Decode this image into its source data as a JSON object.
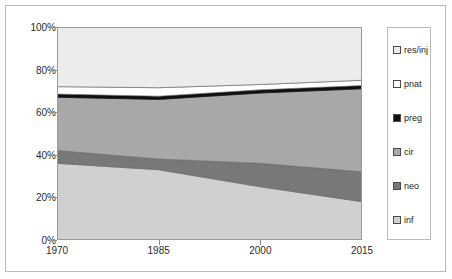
{
  "chart_data": {
    "type": "area",
    "title": "",
    "subtitle": "",
    "xlabel": "",
    "ylabel": "",
    "stacked": true,
    "normalized_percent": true,
    "grid": false,
    "legend_position": "right",
    "x": [
      1970,
      1985,
      2000,
      2015
    ],
    "xtick_labels": [
      "1970",
      "1985",
      "2000",
      "2015"
    ],
    "xlim": [
      1970,
      2015
    ],
    "ytick_labels": [
      "0%",
      "20%",
      "40%",
      "60%",
      "80%",
      "100%"
    ],
    "ytick_values": [
      0,
      20,
      40,
      60,
      80,
      100
    ],
    "ylim": [
      0,
      100
    ],
    "series": [
      {
        "name": "inf",
        "order": 1,
        "color": "#d0d0d0",
        "values": [
          36.0,
          33.0,
          25.0,
          18.0
        ]
      },
      {
        "name": "neo",
        "order": 2,
        "color": "#787878",
        "values": [
          6.0,
          5.0,
          11.0,
          14.0
        ]
      },
      {
        "name": "cir",
        "order": 3,
        "color": "#a8a8a8",
        "values": [
          25.0,
          28.0,
          33.0,
          39.0
        ]
      },
      {
        "name": "preg",
        "order": 4,
        "color": "#101010",
        "values": [
          1.5,
          1.5,
          1.5,
          1.5
        ]
      },
      {
        "name": "pnat",
        "order": 5,
        "color": "#ffffff",
        "values": [
          3.5,
          4.0,
          2.5,
          2.5
        ]
      },
      {
        "name": "res/inj",
        "order": 6,
        "color": "#ececec",
        "values": [
          28.0,
          28.5,
          27.0,
          25.0
        ]
      }
    ],
    "cumulative_tops": {
      "inf": [
        36.0,
        33.0,
        25.0,
        18.0
      ],
      "neo": [
        42.0,
        38.0,
        36.0,
        32.0
      ],
      "cir": [
        67.0,
        66.0,
        69.0,
        71.0
      ],
      "preg": [
        68.5,
        67.5,
        70.5,
        72.5
      ],
      "pnat": [
        72.0,
        71.5,
        73.0,
        75.0
      ],
      "res/inj": [
        100.0,
        100.0,
        100.0,
        100.0
      ]
    }
  },
  "legend": {
    "items": [
      {
        "label": "res/inj",
        "color": "#ececec"
      },
      {
        "label": "pnat",
        "color": "#ffffff"
      },
      {
        "label": "preg",
        "color": "#101010"
      },
      {
        "label": "cir",
        "color": "#a8a8a8"
      },
      {
        "label": "neo",
        "color": "#787878"
      },
      {
        "label": "inf",
        "color": "#d0d0d0"
      }
    ]
  },
  "axes": {
    "y_ticks": [
      "100%",
      "80%",
      "60%",
      "40%",
      "20%",
      "0%"
    ],
    "x_ticks": [
      "1970",
      "1985",
      "2000",
      "2015"
    ]
  },
  "colors": {
    "plot_border": "#9a9a9a",
    "figure_border": "#b9b9b9",
    "tick_color": "#8d8d8d",
    "text": "#2b2b2b",
    "background": "#ffffff"
  }
}
